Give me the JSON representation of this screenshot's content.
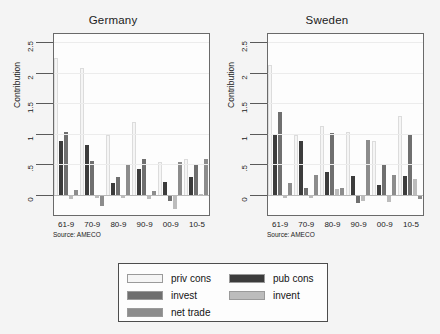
{
  "chart_data": {
    "type": "bar",
    "title": "",
    "ylabel": "Contribution",
    "xlabel": "",
    "ylim": [
      -0.35,
      2.65
    ],
    "yticks": [
      "0",
      ".5",
      "1",
      "1.5",
      "2",
      "2.5"
    ],
    "ytick_values": [
      0,
      0.5,
      1,
      1.5,
      2,
      2.5
    ],
    "grid": true,
    "legend_position": "below",
    "categories": [
      "61-9",
      "70-9",
      "80-9",
      "90-9",
      "00-9",
      "10-5"
    ],
    "series_names": [
      "priv cons",
      "pub cons",
      "invest",
      "invent",
      "net trade"
    ],
    "panels": [
      {
        "name": "Germany",
        "source": "Source: AMECO",
        "series": [
          {
            "name": "priv cons",
            "color": "#f5f5f5",
            "values": [
              2.25,
              2.1,
              1.0,
              1.2,
              0.55,
              0.6
            ]
          },
          {
            "name": "pub cons",
            "color": "#3c3c3c",
            "values": [
              0.9,
              0.83,
              0.2,
              0.44,
              0.22,
              0.3
            ]
          },
          {
            "name": "invest",
            "color": "#6f6f6f",
            "values": [
              1.05,
              0.57,
              0.3,
              0.6,
              -0.08,
              0.5
            ]
          },
          {
            "name": "invent",
            "color": "#bcbcbc",
            "values": [
              -0.05,
              -0.02,
              -0.02,
              -0.05,
              -0.22,
              0.02
            ]
          },
          {
            "name": "net trade",
            "color": "#8c8c8c",
            "values": [
              0.1,
              -0.17,
              0.5,
              0.07,
              0.55,
              0.6
            ]
          }
        ]
      },
      {
        "name": "Sweden",
        "source": "Source: AMECO",
        "series": [
          {
            "name": "priv cons",
            "color": "#f5f5f5",
            "values": [
              2.15,
              1.0,
              1.15,
              1.05,
              0.9,
              1.3
            ]
          },
          {
            "name": "pub cons",
            "color": "#3c3c3c",
            "values": [
              1.0,
              0.9,
              0.38,
              0.33,
              0.18,
              0.32
            ]
          },
          {
            "name": "invest",
            "color": "#6f6f6f",
            "values": [
              1.37,
              0.13,
              1.03,
              -0.12,
              0.5,
              1.01
            ]
          },
          {
            "name": "invent",
            "color": "#bcbcbc",
            "values": [
              -0.02,
              -0.02,
              0.11,
              -0.08,
              -0.1,
              0.27
            ]
          },
          {
            "name": "net trade",
            "color": "#8c8c8c",
            "values": [
              0.21,
              0.34,
              0.12,
              0.92,
              0.34,
              -0.05
            ]
          }
        ]
      }
    ],
    "legend": [
      {
        "label": "priv cons",
        "color": "#f5f5f5"
      },
      {
        "label": "pub cons",
        "color": "#3c3c3c"
      },
      {
        "label": "invest",
        "color": "#6f6f6f"
      },
      {
        "label": "invent",
        "color": "#bcbcbc"
      },
      {
        "label": "net trade",
        "color": "#8c8c8c"
      }
    ]
  },
  "panel_germany": {
    "title": "Germany",
    "ylabel": "Contribution",
    "source": "Source: AMECO"
  },
  "panel_sweden": {
    "title": "Sweden",
    "ylabel": "Contribution",
    "source": "Source: AMECO"
  }
}
